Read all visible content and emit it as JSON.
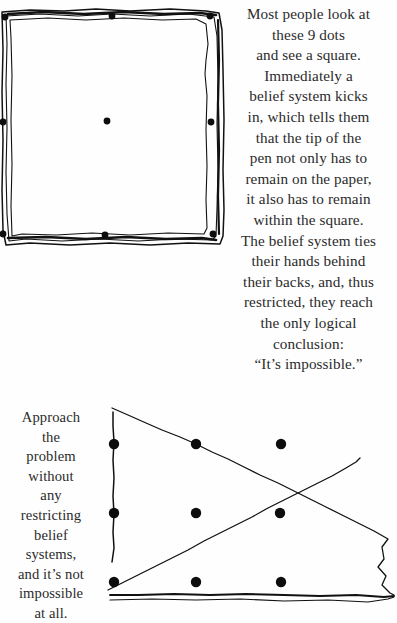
{
  "page": {
    "background_color": "#fefefe",
    "ink_color": "#111111",
    "width": 397,
    "height": 623
  },
  "top_text": {
    "paragraph": "Most people look at\nthese 9 dots\nand see a square.\nImmediately a\nbelief system kicks\nin, which tells them\nthat the tip of the\npen not only has to\nremain on the paper,\nit also has to remain\nwithin the square.\nThe belief system ties\ntheir hands behind\ntheir backs, and, thus\nrestricted, they reach\nthe only logical\nconclusion:\n“It’s impossible.”",
    "lines": [
      "Most people look at",
      "these 9 dots",
      "and see a square.",
      "Immediately a",
      "belief system kicks",
      "in, which tells them",
      "that the tip of the",
      "pen not only has to",
      "remain on the paper,",
      "it also has to remain",
      "within the square.",
      "The belief system ties",
      "their hands behind",
      "their backs, and, thus",
      "restricted, they reach",
      "the only logical",
      "conclusion:",
      "“It’s impossible.”"
    ]
  },
  "bottom_text": {
    "paragraph": "Approach\nthe\nproblem\nwithout\nany\nrestricting\nbelief\nsystems,\nand it’s not\nimpossible\nat all.",
    "lines": [
      "Approach",
      "the",
      "problem",
      "without",
      "any",
      "restricting",
      "belief",
      "systems,",
      "and it’s not",
      "impossible",
      "at all."
    ]
  },
  "figure_square": {
    "caption_semantic": "nine-dots-enclosed-in-hand-drawn-square",
    "dot_count": 9,
    "dots": [
      {
        "x": 5,
        "y": 17,
        "r": 3.4
      },
      {
        "x": 112,
        "y": 16,
        "r": 3.4
      },
      {
        "x": 210,
        "y": 16,
        "r": 3.4
      },
      {
        "x": 3,
        "y": 122,
        "r": 3.4
      },
      {
        "x": 107,
        "y": 121,
        "r": 3.4
      },
      {
        "x": 211,
        "y": 122,
        "r": 3.4
      },
      {
        "x": 3,
        "y": 234,
        "r": 3.4
      },
      {
        "x": 105,
        "y": 235,
        "r": 3.4
      },
      {
        "x": 213,
        "y": 234,
        "r": 3.4
      }
    ],
    "box_paths": [
      "M 2,12 L 30,10 L 64,11 L 96,9 L 130,11 L 170,9 L 206,11 L 219,13 L 222,30 L 223,70 L 224,120 L 223,170 L 224,210 L 223,236 L 220,244 L 188,243 L 150,245 L 110,243 L 70,245 L 30,243 L 6,245 L 3,230 L 2,190 L 3,140 L 2,92 L 3,50 Z",
      "M 6,16 L 40,14 L 78,16 L 112,14 L 150,16 L 188,14 L 214,17 L 217,36 L 218,78 L 217,124 L 218,168 L 217,208 L 216,236 L 212,240 L 176,239 L 138,241 L 100,239 L 62,241 L 26,239 L 9,241 L 7,214 L 6,172 L 7,128 L 6,84 L 7,44 Z",
      "M 10,20 L 48,18 L 86,20 L 124,18 L 162,20 L 196,19 L 206,24 L 208,44 L 206,60 L 205,74 L 207,96 L 206,130 L 207,166 L 206,200 L 207,228 L 204,234 L 168,233 L 130,235 L 92,233 L 56,235 L 22,234 L 12,236 L 11,206 L 12,164 L 11,120 L 12,76 L 11,38 Z"
    ]
  },
  "figure_solution": {
    "caption_semantic": "nine-dots-solved-with-lines-outside-the-box",
    "dot_count": 9,
    "dots": [
      {
        "x": 26,
        "y": 58,
        "r": 5.2
      },
      {
        "x": 108,
        "y": 58,
        "r": 5.2
      },
      {
        "x": 193,
        "y": 58,
        "r": 5.2
      },
      {
        "x": 26,
        "y": 127,
        "r": 5.2
      },
      {
        "x": 108,
        "y": 127,
        "r": 5.2
      },
      {
        "x": 192,
        "y": 127,
        "r": 5.2
      },
      {
        "x": 26,
        "y": 196,
        "r": 5.2
      },
      {
        "x": 108,
        "y": 196,
        "r": 5.2
      },
      {
        "x": 193,
        "y": 196,
        "r": 5.2
      }
    ],
    "stroke_paths": [
      "M 25,26 L 25,40 L 26,56 L 25,74 L 26,92 L 25,110 L 26,128 L 25,146 L 26,162 L 24,176",
      "M 24,22 L 40,29 L 58,37 L 74,44 L 92,51 L 108,58 L 124,66 L 140,73 L 156,81 L 172,89 L 190,97 L 206,105 L 222,113 L 238,121 L 254,129 L 270,137 L 286,145 L 300,153 L 294,161 L 296,173 L 290,181 L 298,190 L 294,199 L 302,207 L 306,209",
      "M 20,204 L 36,196 L 52,188 L 68,180 L 84,172 L 100,164 L 116,155 L 132,147 L 148,139 L 164,131 L 180,122 L 196,114 L 212,106 L 228,98 L 244,90 L 258,82 L 268,76 L 272,72",
      "M 22,209 L 50,209 L 86,208 L 122,209 L 158,208 L 196,209 L 232,210 L 268,209 L 296,211 L 306,210"
    ]
  }
}
